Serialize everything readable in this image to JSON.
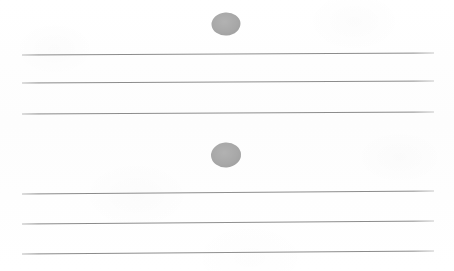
{
  "figure": {
    "background_color": "#fefefe",
    "width": 454,
    "height": 271
  },
  "staff": {
    "line_color": "#8f8f8f",
    "line_count": 6,
    "x_start": 22,
    "x_end": 434,
    "lines": [
      {
        "id": "staff-line-1",
        "group": "upper",
        "index": 1,
        "y_left": 55,
        "y_right": 53,
        "thickness": 1.1
      },
      {
        "id": "staff-line-2",
        "group": "upper",
        "index": 2,
        "y_left": 83,
        "y_right": 81,
        "thickness": 1.1
      },
      {
        "id": "staff-line-3",
        "group": "upper",
        "index": 3,
        "y_left": 114,
        "y_right": 112,
        "thickness": 1.1
      },
      {
        "id": "staff-line-4",
        "group": "lower",
        "index": 4,
        "y_left": 194,
        "y_right": 191,
        "thickness": 1.1
      },
      {
        "id": "staff-line-5",
        "group": "lower",
        "index": 5,
        "y_left": 224,
        "y_right": 221,
        "thickness": 1.1
      },
      {
        "id": "staff-line-6",
        "group": "lower",
        "index": 6,
        "y_left": 254,
        "y_right": 251,
        "thickness": 1.1
      }
    ]
  },
  "notes": {
    "fill_color": "#a8a8a8",
    "items": [
      {
        "id": "note-head-1",
        "position": "above-upper-staff",
        "cx": 226,
        "cy": 24,
        "rx": 14.5,
        "ry": 11.5,
        "rotation": -4
      },
      {
        "id": "note-head-2",
        "position": "between-staff-groups",
        "cx": 226,
        "cy": 155,
        "rx": 15.0,
        "ry": 12.5,
        "rotation": -4
      }
    ]
  }
}
